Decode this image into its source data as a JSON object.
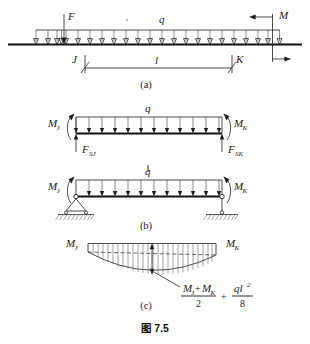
{
  "figure": {
    "caption": "图 7.5",
    "parts": [
      {
        "key": "a",
        "label": "(a)"
      },
      {
        "key": "b",
        "label": "(b)"
      },
      {
        "key": "c",
        "label": "(c)"
      }
    ]
  },
  "part_a": {
    "name": "continuous-beam-with-loads",
    "load_distributed": "q",
    "point_load": "F",
    "end_moment": "M",
    "node_left": "J",
    "node_right": "K",
    "span_label": "l",
    "part_label": "(a)"
  },
  "part_b": {
    "name": "isolated-span-free-body",
    "upper": {
      "load_distributed": "q",
      "moment_left": "M",
      "moment_left_sub": "J",
      "moment_right": "M",
      "moment_right_sub": "K",
      "shear_left": "F",
      "shear_left_sub": "SJ",
      "shear_right": "F",
      "shear_right_sub": "SK"
    },
    "equivalence_symbol": "‖",
    "lower": {
      "load_distributed": "q",
      "moment_left": "M",
      "moment_left_sub": "J",
      "moment_right": "M",
      "moment_right_sub": "K",
      "support_left": "pin-support",
      "support_right": "roller-support"
    },
    "part_label": "(b)"
  },
  "part_c": {
    "name": "bending-moment-diagram",
    "moment_left": "M",
    "moment_left_sub": "J",
    "moment_right": "M",
    "moment_right_sub": "K",
    "formula": {
      "term1_numerator_m1": "M",
      "term1_numerator_m1_sub": "J",
      "term1_numerator_plus": "+",
      "term1_numerator_m2": "M",
      "term1_numerator_m2_sub": "K",
      "term1_denominator": "2",
      "operator": "+",
      "term2_numerator": "ql",
      "term2_numerator_exp": "2",
      "term2_denominator": "8"
    },
    "part_label": "(c)"
  },
  "colors": {
    "ink": "#1f1f1f",
    "ink_strong": "#111111",
    "hatch": "#5a5a5a",
    "background": "#ffffff"
  }
}
